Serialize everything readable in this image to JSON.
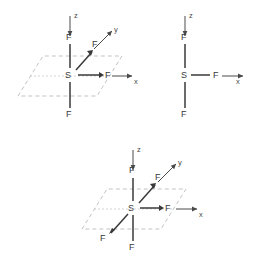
{
  "figure": {
    "title": "",
    "background_color": "#ffffff",
    "line_color": "#3a3a3a",
    "plane_color": "#b4b4b4",
    "label_color": "#2e2e2e"
  },
  "diagrams": [
    {
      "id": "diagram-top-left",
      "center_atom": "S",
      "has_plane": true,
      "axes": [
        {
          "name": "z",
          "label": "z",
          "direction": "up"
        },
        {
          "name": "y",
          "label": "y",
          "direction": "up-right"
        },
        {
          "name": "x",
          "label": "x",
          "direction": "right"
        }
      ],
      "ligands": [
        {
          "label": "F",
          "direction": "up"
        },
        {
          "label": "F",
          "direction": "up-right"
        },
        {
          "label": "F",
          "direction": "right"
        },
        {
          "label": "F",
          "direction": "down"
        }
      ]
    },
    {
      "id": "diagram-top-right",
      "center_atom": "S",
      "has_plane": false,
      "axes": [
        {
          "name": "z",
          "label": "z",
          "direction": "up"
        },
        {
          "name": "x",
          "label": "x",
          "direction": "right"
        }
      ],
      "ligands": [
        {
          "label": "F",
          "direction": "up"
        },
        {
          "label": "F",
          "direction": "right"
        },
        {
          "label": "F",
          "direction": "down"
        }
      ]
    },
    {
      "id": "diagram-bottom",
      "center_atom": "S",
      "has_plane": true,
      "axes": [
        {
          "name": "z",
          "label": "z",
          "direction": "up"
        },
        {
          "name": "y",
          "label": "y",
          "direction": "up-right"
        },
        {
          "name": "x",
          "label": "x",
          "direction": "right"
        }
      ],
      "ligands": [
        {
          "label": "F",
          "direction": "up"
        },
        {
          "label": "F",
          "direction": "up-right"
        },
        {
          "label": "F",
          "direction": "right"
        },
        {
          "label": "F",
          "direction": "down-left"
        },
        {
          "label": "F",
          "direction": "down"
        }
      ]
    }
  ],
  "labels": {
    "d1": {
      "axis_z": "z",
      "axis_y": "y",
      "axis_x": "x",
      "center": "S",
      "f_up": "F",
      "f_upright": "F",
      "f_right": "F",
      "f_down": "F"
    },
    "d2": {
      "axis_z": "z",
      "axis_x": "x",
      "center": "S",
      "f_up": "F",
      "f_right": "F",
      "f_down": "F"
    },
    "d3": {
      "axis_z": "z",
      "axis_y": "y",
      "axis_x": "x",
      "center": "S",
      "f_up": "F",
      "f_upright": "F",
      "f_right": "F",
      "f_downleft": "F",
      "f_down": "F"
    }
  }
}
